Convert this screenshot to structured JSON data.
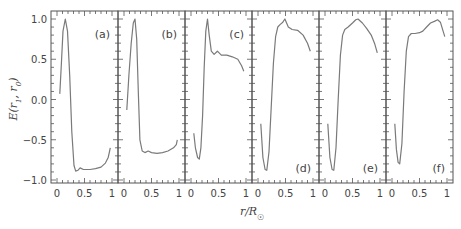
{
  "chart_data": {
    "type": "line",
    "title": "",
    "xlabel": "r/R☉",
    "ylabel": "E(r1, r0)",
    "ylim": [
      -1.0,
      1.0
    ],
    "xlim": [
      0,
      1
    ],
    "yticks": [
      "1.0",
      "0.5",
      "0.0",
      "−0.5",
      "−1.0"
    ],
    "xticks": [
      "0",
      "0.5",
      "1"
    ],
    "grid": false,
    "legend": null,
    "panels": [
      {
        "label": "(a)",
        "label_pos": "top-right",
        "x": [
          0.05,
          0.08,
          0.11,
          0.15,
          0.19,
          0.23,
          0.27,
          0.31,
          0.34,
          0.38,
          0.42,
          0.48,
          0.6,
          0.7,
          0.8,
          0.88,
          0.93,
          0.97
        ],
        "y": [
          0.07,
          0.45,
          0.85,
          1.0,
          0.85,
          0.3,
          -0.4,
          -0.82,
          -0.89,
          -0.88,
          -0.85,
          -0.87,
          -0.87,
          -0.86,
          -0.84,
          -0.79,
          -0.72,
          -0.6
        ]
      },
      {
        "label": "(b)",
        "label_pos": "top-right",
        "x": [
          0.05,
          0.09,
          0.13,
          0.17,
          0.2,
          0.23,
          0.26,
          0.29,
          0.33,
          0.38,
          0.44,
          0.5,
          0.6,
          0.7,
          0.8,
          0.9,
          0.95,
          0.97
        ],
        "y": [
          -0.13,
          0.3,
          0.7,
          0.95,
          1.0,
          0.75,
          0.1,
          -0.5,
          -0.64,
          -0.66,
          -0.64,
          -0.66,
          -0.67,
          -0.66,
          -0.64,
          -0.6,
          -0.56,
          -0.5
        ]
      },
      {
        "label": "(c)",
        "label_pos": "top-right",
        "x": [
          0.05,
          0.08,
          0.12,
          0.15,
          0.18,
          0.21,
          0.24,
          0.27,
          0.3,
          0.33,
          0.37,
          0.42,
          0.48,
          0.55,
          0.65,
          0.75,
          0.85,
          0.92,
          0.96
        ],
        "y": [
          -0.42,
          -0.6,
          -0.72,
          -0.74,
          -0.6,
          -0.2,
          0.4,
          0.85,
          1.0,
          0.8,
          0.6,
          0.56,
          0.6,
          0.55,
          0.55,
          0.53,
          0.5,
          0.42,
          0.35
        ]
      },
      {
        "label": "(d)",
        "label_pos": "bottom-right",
        "x": [
          0.05,
          0.09,
          0.13,
          0.16,
          0.2,
          0.24,
          0.28,
          0.32,
          0.36,
          0.4,
          0.45,
          0.49,
          0.55,
          0.62,
          0.72,
          0.82,
          0.9,
          0.95
        ],
        "y": [
          -0.3,
          -0.72,
          -0.87,
          -0.88,
          -0.65,
          -0.1,
          0.45,
          0.78,
          0.9,
          0.93,
          0.96,
          1.0,
          0.9,
          0.87,
          0.86,
          0.8,
          0.7,
          0.6
        ]
      },
      {
        "label": "(e)",
        "label_pos": "bottom-right",
        "x": [
          0.05,
          0.09,
          0.13,
          0.16,
          0.2,
          0.24,
          0.28,
          0.32,
          0.36,
          0.42,
          0.5,
          0.56,
          0.6,
          0.68,
          0.76,
          0.84,
          0.9,
          0.95
        ],
        "y": [
          -0.3,
          -0.72,
          -0.87,
          -0.88,
          -0.6,
          0.0,
          0.55,
          0.8,
          0.87,
          0.9,
          0.95,
          0.99,
          1.0,
          0.95,
          0.88,
          0.8,
          0.7,
          0.58
        ]
      },
      {
        "label": "(f)",
        "label_pos": "bottom-right",
        "x": [
          0.05,
          0.08,
          0.11,
          0.14,
          0.18,
          0.22,
          0.26,
          0.3,
          0.35,
          0.42,
          0.5,
          0.56,
          0.63,
          0.7,
          0.77,
          0.83,
          0.88,
          0.93,
          0.96
        ],
        "y": [
          -0.3,
          -0.62,
          -0.78,
          -0.8,
          -0.55,
          0.1,
          0.6,
          0.78,
          0.82,
          0.82,
          0.83,
          0.85,
          0.9,
          0.95,
          0.97,
          0.99,
          0.96,
          0.85,
          0.78
        ]
      }
    ]
  },
  "colors": {
    "trace": "#7a7a7a",
    "axis": "#555555",
    "text": "#444444"
  }
}
